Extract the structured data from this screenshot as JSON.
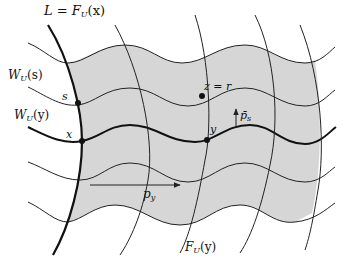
{
  "diagram": {
    "colors": {
      "shade": "#d6d6d6",
      "line": "#222222",
      "background": "#ffffff"
    },
    "labels": {
      "L_eq": "L = F",
      "L_sub": "U",
      "L_arg": "(x)",
      "Ws_main": "W",
      "Ws_sub": "U",
      "Ws_arg": "(s)",
      "Wy_main": "W",
      "Wy_sub": "U",
      "Wy_arg": "(y)",
      "s": "s",
      "x": "x",
      "y": "y",
      "z_eq_r": "z = r",
      "p_s": "p̄",
      "p_s_sub": "s",
      "p_y": "p",
      "p_y_sub": "y",
      "Fy_main": "F",
      "Fy_sub": "U",
      "Fy_arg": "(y)"
    },
    "points": [
      {
        "name": "s",
        "x": 78,
        "y": 103
      },
      {
        "name": "z=r",
        "x": 203,
        "y": 97
      },
      {
        "name": "x",
        "x": 82,
        "y": 141
      },
      {
        "name": "y",
        "x": 207,
        "y": 140
      }
    ]
  }
}
